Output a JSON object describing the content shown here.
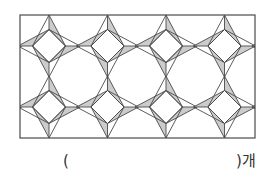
{
  "figure": {
    "colors": {
      "stroke": "#4a4a4a",
      "shaded": "#cccccc",
      "background": "#ffffff"
    },
    "columns": 4,
    "rows": 2
  },
  "answer": {
    "open_paren": "(",
    "close_paren_unit": ")개",
    "value": ""
  }
}
